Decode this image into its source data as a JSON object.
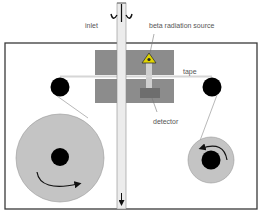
{
  "diagram": {
    "labels": {
      "inlet": "inlet",
      "source": "beta radiation source",
      "tape": "tape",
      "detector": "detector"
    },
    "colors": {
      "outline": "#3a3a3a",
      "chamber": "#8c8c8c",
      "reel": "#c4c4c4",
      "hub": "#000000",
      "tube": "#d9d9d9",
      "hazard": "#e0d400",
      "detector": "#6e6e6e"
    },
    "components": [
      {
        "id": "inlet-tube",
        "label": "inlet"
      },
      {
        "id": "measurement-chamber"
      },
      {
        "id": "beta-source",
        "label": "beta radiation source"
      },
      {
        "id": "detector",
        "label": "detector"
      },
      {
        "id": "tape",
        "label": "tape"
      },
      {
        "id": "supply-reel",
        "rotation": "clockwise"
      },
      {
        "id": "take-up-reel",
        "rotation": "counter-clockwise"
      },
      {
        "id": "left-guide-roller"
      },
      {
        "id": "right-guide-roller"
      },
      {
        "id": "outlet-arrow"
      }
    ]
  }
}
